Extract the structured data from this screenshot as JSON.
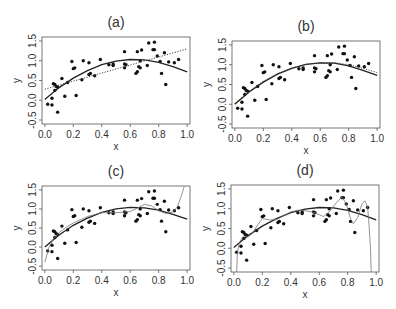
{
  "figure": {
    "panels_layout": "2x2",
    "shared_points": [
      [
        0.02,
        -0.1
      ],
      [
        0.05,
        -0.12
      ],
      [
        0.05,
        0.05
      ],
      [
        0.06,
        0.42
      ],
      [
        0.07,
        0.4
      ],
      [
        0.07,
        0.25
      ],
      [
        0.08,
        0.35
      ],
      [
        0.09,
        0.33
      ],
      [
        0.09,
        -0.3
      ],
      [
        0.12,
        0.55
      ],
      [
        0.14,
        0.1
      ],
      [
        0.16,
        0.45
      ],
      [
        0.19,
        0.98
      ],
      [
        0.2,
        0.8
      ],
      [
        0.21,
        0.82
      ],
      [
        0.22,
        0.12
      ],
      [
        0.26,
        0.52
      ],
      [
        0.27,
        1.0
      ],
      [
        0.31,
        0.95
      ],
      [
        0.31,
        0.65
      ],
      [
        0.32,
        0.68
      ],
      [
        0.35,
        0.62
      ],
      [
        0.39,
        1.03
      ],
      [
        0.45,
        0.9
      ],
      [
        0.48,
        0.92
      ],
      [
        0.48,
        0.88
      ],
      [
        0.56,
        1.23
      ],
      [
        0.56,
        0.92
      ],
      [
        0.56,
        0.82
      ],
      [
        0.57,
        0.9
      ],
      [
        0.64,
        0.68
      ],
      [
        0.65,
        1.23
      ],
      [
        0.65,
        0.72
      ],
      [
        0.66,
        0.85
      ],
      [
        0.67,
        1.0
      ],
      [
        0.67,
        0.82
      ],
      [
        0.68,
        1.27
      ],
      [
        0.72,
        0.88
      ],
      [
        0.73,
        1.45
      ],
      [
        0.76,
        1.28
      ],
      [
        0.77,
        1.47
      ],
      [
        0.77,
        1.28
      ],
      [
        0.79,
        1.12
      ],
      [
        0.81,
        0.98
      ],
      [
        0.82,
        0.68
      ],
      [
        0.84,
        1.2
      ],
      [
        0.85,
        0.4
      ],
      [
        0.87,
        0.97
      ],
      [
        0.91,
        0.95
      ],
      [
        0.94,
        1.03
      ]
    ]
  },
  "chart_data": [
    {
      "type": "scatter",
      "title": "(a)",
      "xlabel": "x",
      "ylabel": "y",
      "xlim": [
        -0.02,
        1.02
      ],
      "ylim": [
        -0.6,
        1.6
      ],
      "xticks": [
        "0.0",
        "0.2",
        "0.4",
        "0.6",
        "0.8",
        "1.0"
      ],
      "yticks": [
        "-0.5",
        "0.0",
        "0.5",
        "1.0",
        "1.5"
      ],
      "grid": false,
      "box": {
        "x": 42,
        "y": 37,
        "w": 148,
        "h": 87
      },
      "series": [
        {
          "name": "data",
          "kind": "points",
          "ref": "shared_points"
        },
        {
          "name": "quadratic fit",
          "kind": "line",
          "style": "solid",
          "x": [
            0.0,
            0.1,
            0.2,
            0.3,
            0.4,
            0.5,
            0.6,
            0.7,
            0.8,
            0.9,
            1.0
          ],
          "y": [
            0.02,
            0.32,
            0.56,
            0.75,
            0.9,
            0.99,
            1.03,
            1.02,
            0.96,
            0.85,
            0.72
          ]
        },
        {
          "name": "linear fit",
          "kind": "line",
          "style": "dotted",
          "x": [
            0.0,
            1.0
          ],
          "y": [
            0.28,
            1.3
          ]
        }
      ]
    },
    {
      "type": "scatter",
      "title": "(b)",
      "xlabel": "x",
      "ylabel": "y",
      "xlim": [
        -0.02,
        1.02
      ],
      "ylim": [
        -0.6,
        1.6
      ],
      "xticks": [
        "0.0",
        "0.2",
        "0.4",
        "0.6",
        "0.8",
        "1.0"
      ],
      "yticks": [
        "-0.5",
        "0.0",
        "0.5",
        "1.0",
        "1.5"
      ],
      "grid": false,
      "box": {
        "x": 232,
        "y": 41,
        "w": 148,
        "h": 87
      },
      "series": [
        {
          "name": "data",
          "kind": "points",
          "ref": "shared_points"
        },
        {
          "name": "quadratic fit",
          "kind": "line",
          "style": "solid",
          "x": [
            0.0,
            0.1,
            0.2,
            0.3,
            0.4,
            0.5,
            0.6,
            0.7,
            0.8,
            0.9,
            1.0
          ],
          "y": [
            0.0,
            0.31,
            0.56,
            0.76,
            0.91,
            1.01,
            1.05,
            1.04,
            0.97,
            0.86,
            0.73
          ]
        },
        {
          "name": "alternate fit",
          "kind": "line",
          "style": "dotted",
          "x": [
            0.0,
            0.1,
            0.2,
            0.3,
            0.4,
            0.5,
            0.6,
            0.7,
            0.8,
            0.9,
            1.0
          ],
          "y": [
            0.02,
            0.33,
            0.58,
            0.77,
            0.92,
            1.01,
            1.05,
            1.05,
            1.0,
            0.91,
            0.8
          ]
        }
      ]
    },
    {
      "type": "scatter",
      "title": "(c)",
      "xlabel": "x",
      "ylabel": "y",
      "xlim": [
        -0.02,
        1.02
      ],
      "ylim": [
        -0.6,
        1.6
      ],
      "xticks": [
        "0.0",
        "0.2",
        "0.4",
        "0.6",
        "0.8",
        "1.0"
      ],
      "yticks": [
        "-0.5",
        "0.0",
        "0.5",
        "1.0",
        "1.5"
      ],
      "grid": false,
      "box": {
        "x": 42,
        "y": 186,
        "w": 148,
        "h": 84
      },
      "series": [
        {
          "name": "data",
          "kind": "points",
          "ref": "shared_points"
        },
        {
          "name": "quadratic fit",
          "kind": "line",
          "style": "solid",
          "x": [
            0.0,
            0.1,
            0.2,
            0.3,
            0.4,
            0.5,
            0.6,
            0.7,
            0.8,
            0.9,
            1.0
          ],
          "y": [
            0.0,
            0.32,
            0.57,
            0.76,
            0.91,
            1.0,
            1.04,
            1.03,
            0.97,
            0.86,
            0.73
          ]
        },
        {
          "name": "high-order polynomial fit",
          "kind": "line",
          "style": "thin",
          "x": [
            0.0,
            0.03,
            0.06,
            0.1,
            0.15,
            0.2,
            0.3,
            0.4,
            0.5,
            0.6,
            0.65,
            0.7,
            0.75,
            0.8,
            0.85,
            0.9,
            0.93,
            0.96,
            0.98
          ],
          "y": [
            -0.4,
            0.0,
            0.22,
            0.38,
            0.52,
            0.63,
            0.8,
            0.9,
            0.9,
            0.93,
            1.02,
            1.12,
            1.08,
            0.95,
            0.88,
            0.92,
            1.05,
            1.35,
            1.6
          ]
        }
      ]
    },
    {
      "type": "scatter",
      "title": "(d)",
      "xlabel": "x",
      "ylabel": "y",
      "xlim": [
        -0.02,
        1.02
      ],
      "ylim": [
        -0.6,
        1.6
      ],
      "xticks": [
        "0.0",
        "0.2",
        "0.4",
        "0.6",
        "0.8",
        "1.0"
      ],
      "yticks": [
        "-0.5",
        "0.0",
        "0.5",
        "1.0",
        "1.5"
      ],
      "grid": false,
      "box": {
        "x": 231,
        "y": 185,
        "w": 148,
        "h": 87
      },
      "series": [
        {
          "name": "data",
          "kind": "points",
          "ref": "shared_points"
        },
        {
          "name": "quadratic fit",
          "kind": "line",
          "style": "solid",
          "x": [
            0.0,
            0.1,
            0.2,
            0.3,
            0.4,
            0.5,
            0.6,
            0.7,
            0.8,
            0.9,
            1.0
          ],
          "y": [
            0.02,
            0.32,
            0.56,
            0.75,
            0.9,
            0.99,
            1.03,
            1.02,
            0.96,
            0.85,
            0.72
          ]
        },
        {
          "name": "interpolating fit",
          "kind": "line",
          "style": "thin",
          "x": [
            0.02,
            0.025,
            0.04,
            0.06,
            0.08,
            0.1,
            0.13,
            0.17,
            0.2,
            0.25,
            0.3,
            0.35,
            0.4,
            0.45,
            0.5,
            0.55,
            0.6,
            0.63,
            0.67,
            0.72,
            0.76,
            0.79,
            0.82,
            0.84,
            0.87,
            0.9,
            0.92,
            0.94,
            0.95,
            0.96,
            0.965
          ],
          "y": [
            -0.6,
            -0.1,
            0.15,
            0.28,
            0.3,
            0.28,
            0.38,
            0.6,
            0.75,
            0.72,
            0.72,
            0.82,
            0.92,
            0.96,
            0.95,
            0.92,
            0.85,
            0.8,
            0.92,
            1.15,
            1.3,
            1.12,
            0.75,
            0.62,
            0.78,
            1.12,
            1.2,
            1.05,
            0.6,
            0.0,
            -0.6
          ]
        }
      ]
    }
  ]
}
